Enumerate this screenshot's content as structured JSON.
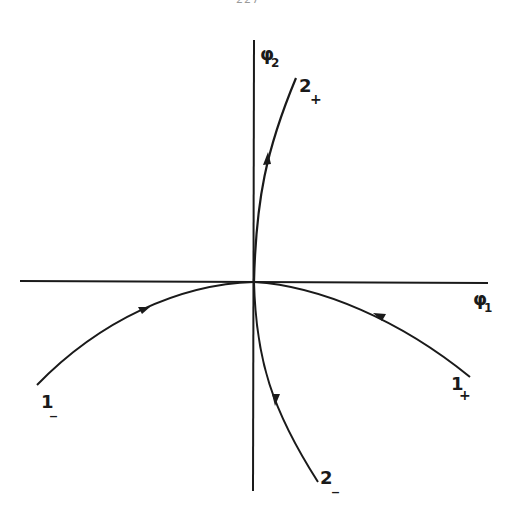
{
  "page": {
    "number_partial": "227"
  },
  "diagram": {
    "type": "phase-portrait",
    "axes": {
      "x_label": "φ",
      "x_subscript": "1",
      "y_label": "φ",
      "y_subscript": "2"
    },
    "curves": [
      {
        "id": "2+",
        "label": "2",
        "sub": "+",
        "direction": "away from origin (upward)"
      },
      {
        "id": "2-",
        "label": "2",
        "sub": "_",
        "direction": "away from origin (downward)"
      },
      {
        "id": "1+",
        "label": "1",
        "sub": "+",
        "direction": "toward origin"
      },
      {
        "id": "1-",
        "label": "1",
        "sub": "_",
        "direction": "toward origin"
      }
    ],
    "colors": {
      "ink": "#1a1a1a",
      "paper": "#ffffff"
    }
  }
}
